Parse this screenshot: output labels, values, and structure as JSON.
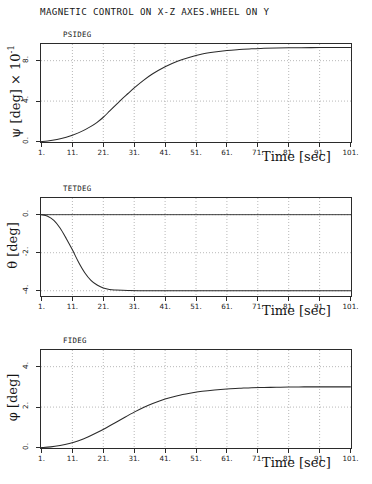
{
  "figure": {
    "title": "MAGNETIC CONTROL ON X-Z AXES.WHEEL ON Y",
    "background": "#ffffff",
    "axis_color": "#2b2b2b",
    "grid_color": "#9a9a9a",
    "curve_color": "#2a2a2a"
  },
  "chart_data": [
    {
      "type": "line",
      "title": "PSIDEG",
      "series_label": "PSIDEG",
      "xlabel": "Time [sec]",
      "ylabel": "ψ [deg] × 10",
      "ylabel_exponent": "-1",
      "ylabel_plain": "psi [deg] x 10^-1",
      "xlim": [
        1,
        101
      ],
      "ylim": [
        0,
        9.6
      ],
      "xticks": [
        "1.",
        "11.",
        "21.",
        "31.",
        "41.",
        "51.",
        "61.",
        "71.",
        "81.",
        "91.",
        "101."
      ],
      "xtick_values": [
        1,
        11,
        21,
        31,
        41,
        51,
        61,
        71,
        81,
        91,
        101
      ],
      "yticks": [
        "0.",
        "4.",
        "8."
      ],
      "ytick_values": [
        0,
        4,
        8
      ],
      "grid": true,
      "grid_style": "dotted",
      "legend": "none",
      "x": [
        1,
        3,
        6,
        9,
        11,
        14,
        17,
        19,
        21,
        23,
        25,
        27,
        29,
        31,
        34,
        37,
        41,
        45,
        49,
        53,
        57,
        61,
        65,
        69,
        73,
        77,
        81,
        85,
        91,
        96,
        101
      ],
      "y": [
        0.0,
        0.05,
        0.2,
        0.42,
        0.62,
        1.0,
        1.5,
        1.9,
        2.4,
        3.0,
        3.6,
        4.2,
        4.75,
        5.3,
        6.05,
        6.7,
        7.4,
        7.95,
        8.35,
        8.65,
        8.85,
        9.0,
        9.1,
        9.18,
        9.22,
        9.25,
        9.27,
        9.28,
        9.3,
        9.3,
        9.3
      ]
    },
    {
      "type": "line",
      "title": "TETDEG",
      "series_label": "TETDEG",
      "xlabel": "Time [sec]",
      "ylabel": "θ [deg]",
      "ylabel_plain": "theta [deg]",
      "xlim": [
        1,
        101
      ],
      "ylim": [
        -4.25,
        0.85
      ],
      "xticks": [
        "1.",
        "11.",
        "21.",
        "31.",
        "41.",
        "51.",
        "61.",
        "71.",
        "81.",
        "91.",
        "101."
      ],
      "xtick_values": [
        1,
        11,
        21,
        31,
        41,
        51,
        61,
        71,
        81,
        91,
        101
      ],
      "yticks": [
        "0.",
        "-2.",
        "-4."
      ],
      "ytick_values": [
        0,
        -2,
        -4
      ],
      "grid": true,
      "grid_style": "dotted",
      "legend": "none",
      "x": [
        1,
        3,
        5,
        7,
        9,
        11,
        13,
        15,
        17,
        19,
        21,
        23,
        25,
        29,
        35,
        41,
        51,
        61,
        71,
        81,
        91,
        101
      ],
      "y": [
        0.0,
        -0.08,
        -0.3,
        -0.7,
        -1.25,
        -1.85,
        -2.5,
        -3.05,
        -3.45,
        -3.7,
        -3.85,
        -3.93,
        -3.96,
        -3.99,
        -4.0,
        -4.0,
        -4.0,
        -4.0,
        -4.0,
        -4.0,
        -4.0,
        -4.0
      ]
    },
    {
      "type": "line",
      "title": "FIDEG",
      "series_label": "FIDEG",
      "xlabel": "Time [sec]",
      "ylabel": "φ [deg]",
      "ylabel_plain": "phi [deg]",
      "xlim": [
        1,
        101
      ],
      "ylim": [
        0,
        4.8
      ],
      "xticks": [
        "1.",
        "11.",
        "21.",
        "31.",
        "41.",
        "51.",
        "61.",
        "71.",
        "81.",
        "91.",
        "101."
      ],
      "xtick_values": [
        1,
        11,
        21,
        31,
        41,
        51,
        61,
        71,
        81,
        91,
        101
      ],
      "yticks": [
        "0.",
        "2.",
        "4."
      ],
      "ytick_values": [
        0,
        2,
        4
      ],
      "grid": true,
      "grid_style": "dotted",
      "legend": "none",
      "x": [
        1,
        4,
        7,
        10,
        13,
        16,
        19,
        22,
        25,
        28,
        31,
        34,
        37,
        41,
        45,
        49,
        53,
        57,
        61,
        65,
        69,
        73,
        77,
        81,
        86,
        91,
        96,
        101
      ],
      "y": [
        0.0,
        0.03,
        0.1,
        0.2,
        0.34,
        0.52,
        0.74,
        0.98,
        1.24,
        1.5,
        1.75,
        1.98,
        2.18,
        2.4,
        2.56,
        2.68,
        2.78,
        2.85,
        2.9,
        2.93,
        2.96,
        2.97,
        2.98,
        2.99,
        3.0,
        3.0,
        3.0,
        3.0
      ]
    }
  ]
}
